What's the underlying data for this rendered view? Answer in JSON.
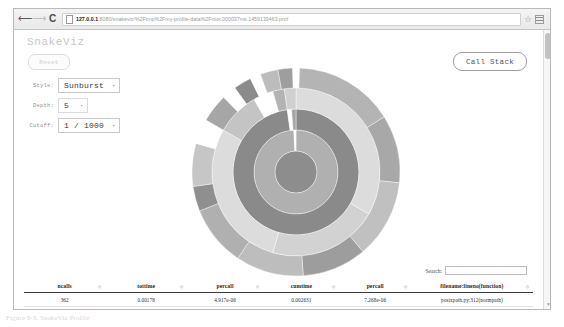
{
  "browser": {
    "back_icon": "back-arrow-icon",
    "forward_icon": "forward-arrow-icon",
    "reload_glyph": "C",
    "star_glyph": "☆",
    "url_host": "127.0.0.1",
    "url_path": ":8080/snakeviz/%2Ftmp%2Fmy-profile-data%2Froot.000037ms.1459139463.prof"
  },
  "app": {
    "title": "SnakeViz",
    "reset_label": "Reset",
    "call_stack_label": "Call Stack",
    "controls": [
      {
        "label": "Style:",
        "value": "Sunburst",
        "caret": "▾"
      },
      {
        "label": "Depth:",
        "value": "5",
        "caret": "▾"
      },
      {
        "label": "Cutoff:",
        "value": "1 / 1000",
        "caret": "▾"
      }
    ]
  },
  "search": {
    "label": "Search:",
    "value": "",
    "placeholder": ""
  },
  "table": {
    "columns": [
      "ncalls",
      "tottime",
      "percall",
      "cumtime",
      "percall",
      "filename:lineno(function)"
    ],
    "sort_glyph": "◇",
    "rows": [
      {
        "ncalls": "362",
        "tottime": "0.00178",
        "percall": "4.917e-06",
        "cumtime": "0.002631",
        "percall2": "7.268e-06",
        "filename": "posixpath.py:312(normpath)"
      }
    ]
  },
  "caption": {
    "text": "Figure 9-3. SnakeViz Profile"
  },
  "colors": {
    "ring_light": "#d8d8d8",
    "ring_mid": "#b8b8b8",
    "ring_dark": "#9a9a9a",
    "ring_darker": "#828282",
    "page_bg": "#ffffff",
    "frame_border": "#b9b9b9"
  },
  "chart_data": {
    "type": "pie",
    "chart_style": "sunburst",
    "depth": 5,
    "cutoff": "1 / 1000",
    "center_x": 104,
    "center_y": 104,
    "rings": [
      {
        "level": 0,
        "inner_radius": 0,
        "outer_radius": 21,
        "slices": [
          {
            "start": 0,
            "end": 360,
            "color": "#8d8d8d"
          }
        ]
      },
      {
        "level": 1,
        "inner_radius": 21,
        "outer_radius": 42,
        "slices": [
          {
            "start": 0,
            "end": 357,
            "color": "#b0b0b0"
          },
          {
            "start": 357,
            "end": 360,
            "color": "#ffffff"
          }
        ]
      },
      {
        "level": 2,
        "inner_radius": 42,
        "outer_radius": 63,
        "slices": [
          {
            "start": 0,
            "end": 352,
            "color": "#8a8a8a"
          },
          {
            "start": 352,
            "end": 356,
            "color": "#ffffff"
          },
          {
            "start": 356,
            "end": 360,
            "color": "#a5a5a5"
          }
        ]
      },
      {
        "level": 3,
        "inner_radius": 63,
        "outer_radius": 84,
        "slices": [
          {
            "start": 0,
            "end": 120,
            "color": "#dcdcdc"
          },
          {
            "start": 120,
            "end": 196,
            "color": "#d2d2d2"
          },
          {
            "start": 196,
            "end": 300,
            "color": "#dcdcdc"
          },
          {
            "start": 300,
            "end": 330,
            "color": "#c4c4c4"
          },
          {
            "start": 330,
            "end": 344,
            "color": "#ffffff"
          },
          {
            "start": 344,
            "end": 352,
            "color": "#b3b3b3"
          },
          {
            "start": 352,
            "end": 360,
            "color": "#d0d0d0"
          }
        ]
      },
      {
        "level": 4,
        "inner_radius": 84,
        "outer_radius": 104,
        "slices": [
          {
            "start": 2,
            "end": 58,
            "color": "#b4b4b4"
          },
          {
            "start": 58,
            "end": 96,
            "color": "#a8a8a8"
          },
          {
            "start": 96,
            "end": 140,
            "color": "#c0c0c0"
          },
          {
            "start": 140,
            "end": 176,
            "color": "#9d9d9d"
          },
          {
            "start": 176,
            "end": 214,
            "color": "#bdbdbd"
          },
          {
            "start": 214,
            "end": 248,
            "color": "#b0b0b0"
          },
          {
            "start": 248,
            "end": 262,
            "color": "#8f8f8f"
          },
          {
            "start": 262,
            "end": 286,
            "color": "#c6c6c6"
          },
          {
            "start": 286,
            "end": 300,
            "color": "#ffffff"
          },
          {
            "start": 300,
            "end": 316,
            "color": "#a6a6a6"
          },
          {
            "start": 316,
            "end": 324,
            "color": "#ffffff"
          },
          {
            "start": 324,
            "end": 334,
            "color": "#8b8b8b"
          },
          {
            "start": 334,
            "end": 340,
            "color": "#ffffff"
          },
          {
            "start": 340,
            "end": 350,
            "color": "#bcbcbc"
          },
          {
            "start": 350,
            "end": 358,
            "color": "#9e9e9e"
          }
        ]
      }
    ]
  }
}
